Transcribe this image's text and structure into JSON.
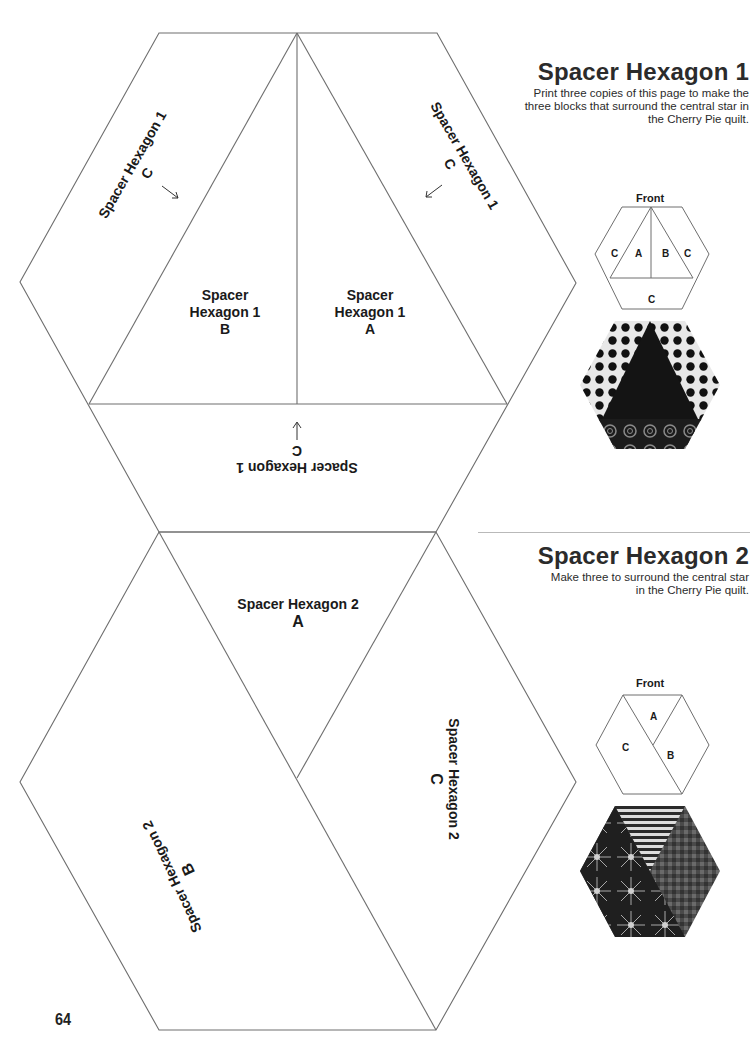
{
  "page": {
    "number": "64"
  },
  "section1": {
    "title": "Spacer Hexagon 1",
    "description": "Print three copies of this page to make the three blocks that surround the central star in the Cherry Pie quilt.",
    "front_label": "Front",
    "diagram_labels": [
      "C",
      "A",
      "B",
      "C",
      "C"
    ],
    "fabric_photo": "hexagon-1-fabric-sample",
    "template": {
      "piece_b": {
        "line1": "Spacer",
        "line2": "Hexagon 1",
        "letter": "B"
      },
      "piece_a": {
        "line1": "Spacer",
        "line2": "Hexagon 1",
        "letter": "A"
      },
      "piece_c_left": {
        "name": "Spacer Hexagon 1",
        "letter": "C"
      },
      "piece_c_right": {
        "name": "Spacer Hexagon 1",
        "letter": "C"
      },
      "piece_c_bottom": {
        "name": "Spacer Hexagon 1",
        "letter": "C"
      }
    }
  },
  "section2": {
    "title": "Spacer Hexagon 2",
    "description": "Make three to surround the central star in the Cherry Pie quilt.",
    "front_label": "Front",
    "diagram_labels": [
      "A",
      "C",
      "B"
    ],
    "fabric_photo": "hexagon-2-fabric-sample",
    "template": {
      "piece_a": {
        "name": "Spacer Hexagon 2",
        "letter": "A"
      },
      "piece_b": {
        "name": "Spacer Hexagon 2",
        "letter": "B"
      },
      "piece_c": {
        "name": "Spacer Hexagon 2",
        "letter": "C"
      }
    }
  },
  "colors": {
    "line": "#6e6e6e",
    "text": "#1a1a1a",
    "rule": "#b9b9b9"
  }
}
